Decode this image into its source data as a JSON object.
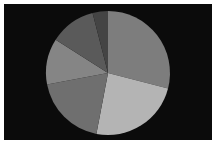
{
  "chart_data": {
    "type": "pie",
    "title": "",
    "categories": [
      "Slice A",
      "Slice B",
      "Slice C",
      "Slice D",
      "Slice E",
      "Slice F"
    ],
    "values": [
      29,
      24,
      19,
      12,
      12,
      4
    ],
    "colors": [
      "#7d7d7d",
      "#b4b4b4",
      "#6f6f6f",
      "#858585",
      "#5a5a5a",
      "#444444"
    ],
    "start_angle_deg": 0,
    "direction": "clockwise",
    "legend": "none",
    "background": "#0b0b0b"
  },
  "caption": ""
}
